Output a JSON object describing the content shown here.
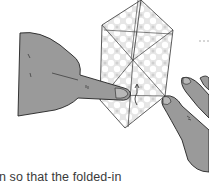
{
  "illustration": {
    "subject": "hands folding a paper diamond",
    "skin_color": "#9a9a9a",
    "outline_color": "#222222",
    "paper_pattern_color": "#d8d8d8"
  },
  "caption": {
    "line1": "n so that the folded-in",
    "line2": ""
  },
  "marker": {
    "dashed_line": "- -"
  }
}
